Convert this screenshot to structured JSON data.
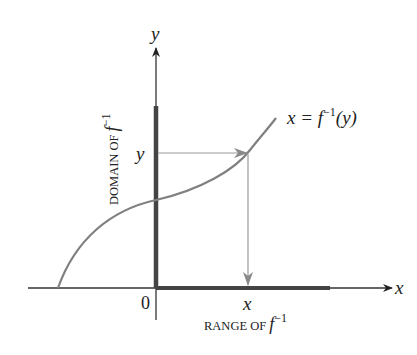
{
  "figure": {
    "curve_label": "x = f",
    "curve_label_sup": "−1",
    "curve_label_arg": "(y)",
    "y_axis_label": "y",
    "x_axis_label": "x",
    "origin_label": "0",
    "y_point_label": "y",
    "x_point_label": "x",
    "domain_label": "DOMAIN OF ",
    "domain_label_f": "f",
    "domain_label_sup": "−1",
    "range_label": "RANGE OF ",
    "range_label_f": "f",
    "range_label_sup": "−1"
  },
  "colors": {
    "axis": "#333333",
    "curve": "#808080",
    "guide": "#9a9a9a",
    "highlight": "#444444"
  }
}
